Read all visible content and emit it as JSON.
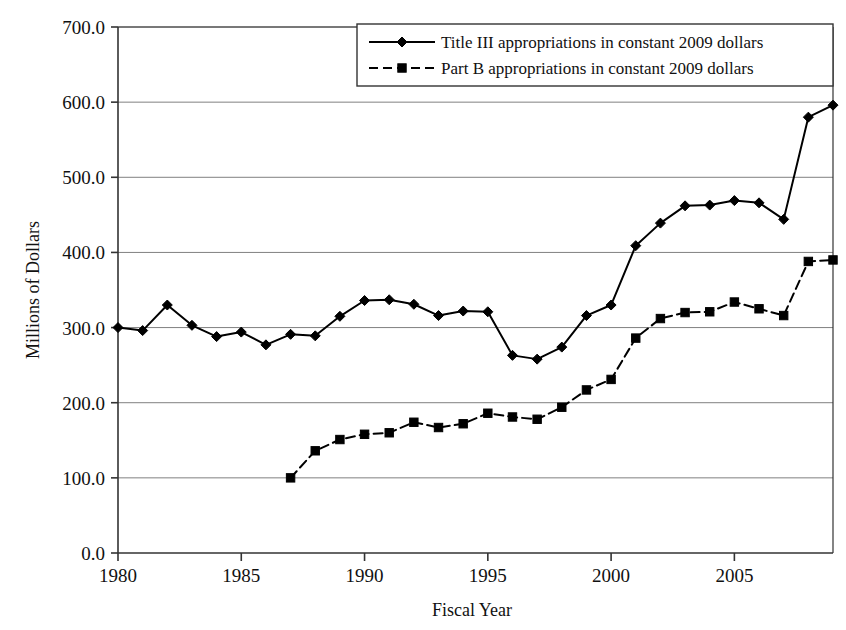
{
  "chart_data": {
    "type": "line",
    "title": "",
    "xlabel": "Fiscal Year",
    "ylabel": "Millions of Dollars",
    "xlim": [
      1980,
      2009
    ],
    "ylim": [
      0.0,
      700.0
    ],
    "ytick_step": 100.0,
    "grid": true,
    "gridlines": "horizontal",
    "legend_position": "top-right",
    "x_tick_labels": [
      "1980",
      "1985",
      "1990",
      "1995",
      "2000",
      "2005"
    ],
    "x_ticks": [
      1980,
      1985,
      1990,
      1995,
      2000,
      2005
    ],
    "y_tick_labels": [
      "0.0",
      "100.0",
      "200.0",
      "300.0",
      "400.0",
      "500.0",
      "600.0",
      "700.0"
    ],
    "y_ticks": [
      0.0,
      100.0,
      200.0,
      300.0,
      400.0,
      500.0,
      600.0,
      700.0
    ],
    "x": [
      1980,
      1981,
      1982,
      1983,
      1984,
      1985,
      1986,
      1987,
      1988,
      1989,
      1990,
      1991,
      1992,
      1993,
      1994,
      1995,
      1996,
      1997,
      1998,
      1999,
      2000,
      2001,
      2002,
      2003,
      2004,
      2005,
      2006,
      2007,
      2008,
      2009
    ],
    "series": [
      {
        "name": "Title III appropriations in constant 2009 dollars",
        "marker": "diamond",
        "line_style": "solid",
        "color": "#000000",
        "x": [
          1980,
          1981,
          1982,
          1983,
          1984,
          1985,
          1986,
          1987,
          1988,
          1989,
          1990,
          1991,
          1992,
          1993,
          1994,
          1995,
          1996,
          1997,
          1998,
          1999,
          2000,
          2001,
          2002,
          2003,
          2004,
          2005,
          2006,
          2007,
          2008,
          2009
        ],
        "values": [
          300,
          296,
          330,
          303,
          288,
          294,
          277,
          291,
          289,
          315,
          336,
          337,
          331,
          316,
          322,
          321,
          263,
          258,
          274,
          316,
          330,
          409,
          439,
          462,
          463,
          469,
          466,
          444,
          580,
          596
        ]
      },
      {
        "name": "Part B appropriations in constant 2009 dollars",
        "marker": "square",
        "line_style": "dashed",
        "color": "#000000",
        "x": [
          1987,
          1988,
          1989,
          1990,
          1991,
          1992,
          1993,
          1994,
          1995,
          1996,
          1997,
          1998,
          1999,
          2000,
          2001,
          2002,
          2003,
          2004,
          2005,
          2006,
          2007,
          2008,
          2009
        ],
        "values": [
          100,
          136,
          151,
          158,
          160,
          174,
          167,
          172,
          186,
          181,
          178,
          194,
          217,
          231,
          286,
          312,
          320,
          321,
          334,
          325,
          316,
          388,
          390
        ]
      }
    ]
  },
  "legend": {
    "items": [
      {
        "label": "Title III appropriations in constant 2009 dollars",
        "marker": "diamond",
        "dash": "none"
      },
      {
        "label": "Part B appropriations in constant 2009 dollars",
        "marker": "square",
        "dash": "dashed"
      }
    ]
  },
  "colors": {
    "line": "#000000",
    "grid": "#808080",
    "axis": "#333333",
    "text": "#111111",
    "background": "#ffffff"
  }
}
